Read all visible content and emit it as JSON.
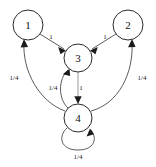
{
  "diagram": {
    "type": "directed-graph",
    "title": "",
    "background_color": "#ffffff",
    "node_stroke_color": "#2b2b2b",
    "edge_color": "#4a4a4a",
    "label_color": "#1a1a1a",
    "nodes": [
      {
        "id": "1",
        "label": "1",
        "cx": 28,
        "cy": 25,
        "r": 15
      },
      {
        "id": "2",
        "label": "2",
        "cx": 128,
        "cy": 25,
        "r": 15
      },
      {
        "id": "3",
        "label": "3",
        "cx": 78,
        "cy": 58,
        "r": 14
      },
      {
        "id": "4",
        "label": "4",
        "cx": 78,
        "cy": 118,
        "r": 14
      }
    ],
    "edges": [
      {
        "from": "1",
        "to": "3",
        "label": "1",
        "label_x": 51,
        "label_y": 37,
        "style": "straight"
      },
      {
        "from": "2",
        "to": "3",
        "label": "1",
        "label_x": 105,
        "label_y": 37,
        "style": "straight"
      },
      {
        "from": "3",
        "to": "4",
        "label": "1",
        "label_x": 81,
        "label_y": 88,
        "style": "straight"
      },
      {
        "from": "4",
        "to": "1",
        "label": "1/4",
        "label_x": 14,
        "label_y": 78,
        "style": "curved-left"
      },
      {
        "from": "4",
        "to": "2",
        "label": "1/4",
        "label_x": 142,
        "label_y": 78,
        "style": "curved-right"
      },
      {
        "from": "4",
        "to": "3",
        "label": "1/4",
        "label_x": 53,
        "label_y": 88,
        "style": "curved-inner"
      },
      {
        "from": "4",
        "to": "4",
        "label": "1/4",
        "label_x": 78,
        "label_y": 157,
        "style": "self-loop"
      }
    ]
  }
}
